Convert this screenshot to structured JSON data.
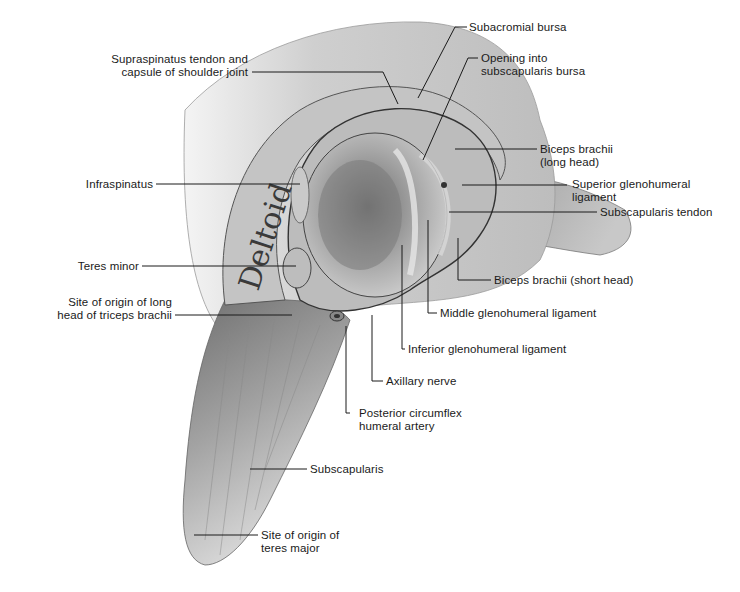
{
  "figure": {
    "muscle_label": "Deltoid",
    "colors": {
      "background": "#ffffff",
      "tissue_light": "#d9d9d9",
      "tissue_mid": "#a8a8a8",
      "tissue_dark": "#4a4a4a",
      "leader_line": "#1a1a1a"
    }
  },
  "labels": {
    "supraspinatus": "Supraspinatus tendon and\ncapsule of shoulder joint",
    "subacromial_bursa": "Subacromial bursa",
    "opening_subscapularis_bursa": "Opening into\nsubscapularis bursa",
    "biceps_long": "Biceps brachii\n(long head)",
    "superior_gh_ligament": "Superior glenohumeral\nligament",
    "subscapularis_tendon": "Subscapularis tendon",
    "infraspinatus": "Infraspinatus",
    "teres_minor": "Teres minor",
    "triceps_origin": "Site of origin of long\nhead of triceps brachii",
    "biceps_short": "Biceps brachii (short head)",
    "middle_gh_ligament": "Middle glenohumeral ligament",
    "inferior_gh_ligament": "Inferior glenohumeral ligament",
    "axillary_nerve": "Axillary nerve",
    "posterior_circumflex": "Posterior circumflex\nhumeral artery",
    "subscapularis": "Subscapularis",
    "teres_major_origin": "Site of origin of\nteres major"
  }
}
